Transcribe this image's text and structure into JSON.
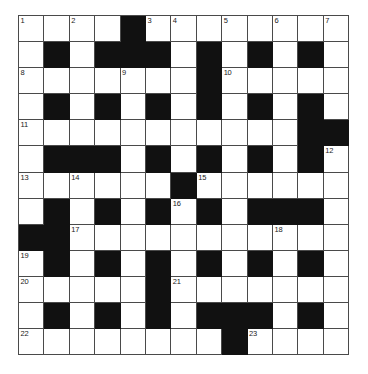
{
  "puzzle": {
    "type": "crossword-grid",
    "title": "Crossword Puzzle Grid",
    "rows": 13,
    "columns": 13,
    "colors": {
      "block": "#111111",
      "cell": "#ffffff",
      "gridline": "#4a4a4a",
      "number": "#1a1a1a",
      "background": "#ffffff"
    },
    "legend": {
      "0": "white-cell",
      "1": "block-cell"
    },
    "grid": [
      [
        0,
        0,
        0,
        0,
        1,
        0,
        0,
        0,
        0,
        0,
        0,
        0,
        0
      ],
      [
        0,
        1,
        0,
        1,
        1,
        1,
        0,
        1,
        0,
        1,
        0,
        1,
        0
      ],
      [
        0,
        0,
        0,
        0,
        0,
        0,
        0,
        1,
        0,
        0,
        0,
        0,
        0
      ],
      [
        0,
        1,
        0,
        1,
        0,
        1,
        0,
        1,
        0,
        1,
        0,
        1,
        0
      ],
      [
        0,
        0,
        0,
        0,
        0,
        0,
        0,
        0,
        0,
        0,
        0,
        1,
        1
      ],
      [
        0,
        1,
        1,
        1,
        0,
        1,
        0,
        1,
        0,
        1,
        0,
        1,
        0
      ],
      [
        0,
        0,
        0,
        0,
        0,
        0,
        1,
        0,
        0,
        0,
        0,
        0,
        0
      ],
      [
        0,
        1,
        0,
        1,
        0,
        1,
        0,
        1,
        0,
        1,
        1,
        1,
        0
      ],
      [
        1,
        1,
        0,
        0,
        0,
        0,
        0,
        0,
        0,
        0,
        0,
        0,
        0
      ],
      [
        0,
        1,
        0,
        1,
        0,
        1,
        0,
        1,
        0,
        1,
        0,
        1,
        0
      ],
      [
        0,
        0,
        0,
        0,
        0,
        1,
        0,
        0,
        0,
        0,
        0,
        0,
        0
      ],
      [
        0,
        1,
        0,
        1,
        0,
        1,
        0,
        1,
        1,
        1,
        0,
        1,
        0
      ],
      [
        0,
        0,
        0,
        0,
        0,
        0,
        0,
        0,
        1,
        0,
        0,
        0,
        0
      ]
    ],
    "numbers": [
      {
        "n": "1",
        "row": 0,
        "col": 0
      },
      {
        "n": "2",
        "row": 0,
        "col": 2
      },
      {
        "n": "3",
        "row": 0,
        "col": 5
      },
      {
        "n": "4",
        "row": 0,
        "col": 6
      },
      {
        "n": "5",
        "row": 0,
        "col": 8
      },
      {
        "n": "6",
        "row": 0,
        "col": 10
      },
      {
        "n": "7",
        "row": 0,
        "col": 12
      },
      {
        "n": "8",
        "row": 2,
        "col": 0
      },
      {
        "n": "9",
        "row": 2,
        "col": 4
      },
      {
        "n": "10",
        "row": 2,
        "col": 8
      },
      {
        "n": "11",
        "row": 4,
        "col": 0
      },
      {
        "n": "12",
        "row": 5,
        "col": 12
      },
      {
        "n": "13",
        "row": 6,
        "col": 0
      },
      {
        "n": "14",
        "row": 6,
        "col": 2
      },
      {
        "n": "15",
        "row": 6,
        "col": 7
      },
      {
        "n": "16",
        "row": 7,
        "col": 6
      },
      {
        "n": "17",
        "row": 8,
        "col": 2
      },
      {
        "n": "18",
        "row": 8,
        "col": 10
      },
      {
        "n": "19",
        "row": 9,
        "col": 0
      },
      {
        "n": "20",
        "row": 10,
        "col": 0
      },
      {
        "n": "21",
        "row": 10,
        "col": 6
      },
      {
        "n": "22",
        "row": 12,
        "col": 0
      },
      {
        "n": "23",
        "row": 12,
        "col": 9
      }
    ]
  }
}
